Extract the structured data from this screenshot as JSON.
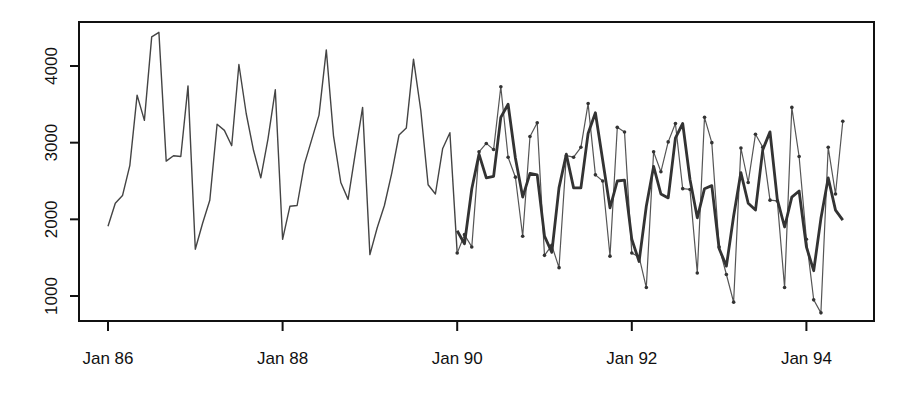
{
  "chart_data": {
    "type": "line",
    "title": "",
    "xlabel": "",
    "ylabel": "",
    "ylim": [
      700,
      4550
    ],
    "grid": false,
    "legend": null,
    "x_ticks": [
      "Jan 86",
      "Jan 88",
      "Jan 90",
      "Jan 92",
      "Jan 94"
    ],
    "y_ticks": [
      1000,
      2000,
      3000,
      4000
    ],
    "x_start": "Jan 86",
    "frequency": "monthly",
    "series": [
      {
        "name": "observed (history)",
        "style": "thin line",
        "start_index": 0,
        "values": [
          1910,
          2210,
          2310,
          2700,
          3620,
          3290,
          4380,
          4440,
          2760,
          2830,
          2820,
          3740,
          1610,
          1950,
          2250,
          3240,
          3160,
          2960,
          4020,
          3380,
          2900,
          2540,
          3050,
          3690,
          1740,
          2170,
          2180,
          2720,
          3040,
          3360,
          4210,
          3090,
          2480,
          2260,
          2870,
          3460,
          1540,
          1890,
          2180,
          2600,
          3100,
          3190,
          4090,
          3420,
          2450,
          2330,
          2920,
          3130
        ]
      },
      {
        "name": "observed (test)",
        "style": "thin line with point markers",
        "start_index": 48,
        "values": [
          1560,
          1800,
          1640,
          2880,
          2990,
          2910,
          3730,
          2810,
          2550,
          1780,
          3080,
          3260,
          1530,
          1660,
          1370,
          2830,
          2810,
          2940,
          3510,
          2580,
          2500,
          1520,
          3200,
          3140,
          1560,
          1510,
          1110,
          2880,
          2620,
          3010,
          3250,
          2400,
          2390,
          1300,
          3330,
          3000,
          1640,
          1280,
          920,
          2930,
          2480,
          3110,
          2940,
          2250,
          2240,
          1110,
          3460,
          2820,
          1740,
          950,
          780,
          2940,
          2330,
          3280
        ]
      },
      {
        "name": "fitted / forecast",
        "style": "thick line",
        "start_index": 48,
        "values": [
          1850,
          1680,
          2400,
          2850,
          2540,
          2560,
          3330,
          3500,
          2800,
          2290,
          2600,
          2580,
          1780,
          1570,
          2410,
          2850,
          2410,
          2410,
          3120,
          3390,
          2770,
          2150,
          2500,
          2510,
          1740,
          1450,
          2170,
          2690,
          2330,
          2280,
          3060,
          3250,
          2520,
          2020,
          2400,
          2440,
          1620,
          1390,
          2040,
          2610,
          2210,
          2120,
          2910,
          3140,
          2260,
          1900,
          2290,
          2370,
          1640,
          1330,
          2010,
          2540,
          2120,
          1990
        ]
      }
    ]
  },
  "axes": {
    "x_labels": [
      "Jan 86",
      "Jan 88",
      "Jan 90",
      "Jan 92",
      "Jan 94"
    ],
    "y_labels": [
      "1000",
      "2000",
      "3000",
      "4000"
    ]
  }
}
